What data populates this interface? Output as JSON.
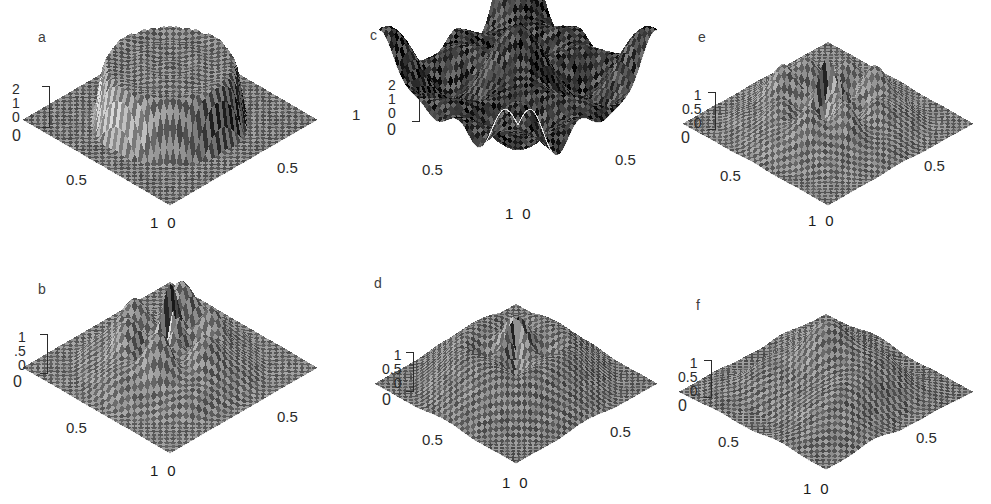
{
  "figure": {
    "type": "multi-panel-3d-surface-figure",
    "background_color": "#ffffff",
    "ink_color": "#2b2b2b",
    "panel_count": 6,
    "grid": "2 rows x 3 columns"
  },
  "panels": [
    {
      "id": "a",
      "letter": "a",
      "z_ticks": [
        "2",
        "1",
        "0"
      ],
      "z_origin_label": "0",
      "x_tick": "0.5",
      "y_tick": "0.5",
      "bottom_left_label": "1",
      "bottom_right_label": "0",
      "extra_right_label": "1",
      "surface": "single broad circular plateau (cylindrical mesa) on a flat base, with a raised rim and a depressed moat in the near quadrant",
      "zmax": 2,
      "shade": "#6e6e6e",
      "noise": 0.22
    },
    {
      "id": "b",
      "letter": "b",
      "z_ticks": [
        "1",
        ".5",
        "0"
      ],
      "z_origin_label": "0",
      "x_tick": "0.5",
      "y_tick": "0.5",
      "bottom_left_label": "1",
      "bottom_right_label": "0",
      "extra_right_label": "",
      "surface": "rippled multi-lobed dome with concentric wave structure and many small ridges",
      "zmax": 1,
      "shade": "#767676",
      "noise": 0.22
    },
    {
      "id": "c",
      "letter": "c",
      "z_ticks": [
        "2",
        "1",
        "0"
      ],
      "z_origin_label": "0",
      "x_tick": "0.5",
      "y_tick": "0.5",
      "bottom_left_label": "1",
      "bottom_right_label": "0",
      "extra_right_label": "",
      "surface": "very dark noisy surface with two broad bright humps near the back and a bright ridged fan in the front corner",
      "zmax": 2,
      "shade": "#2a2a2a",
      "noise": 0.55
    },
    {
      "id": "d",
      "letter": "d",
      "z_ticks": [
        "1",
        "0.5",
        "0"
      ],
      "z_origin_label": "0",
      "x_tick": "0.5",
      "y_tick": "0.5",
      "bottom_left_label": "1",
      "bottom_right_label": "0",
      "extra_right_label": "",
      "surface": "four-lobed ridged structure with deep dark clefts between the lobes, flat dark plateau behind",
      "zmax": 1,
      "shade": "#6b6b6b",
      "noise": 0.3
    },
    {
      "id": "e",
      "letter": "e",
      "z_ticks": [
        "1",
        "0.5",
        "0"
      ],
      "z_origin_label": "0",
      "x_tick": "0.5",
      "y_tick": "0.5",
      "bottom_left_label": "1",
      "bottom_right_label": "0",
      "extra_right_label": "",
      "surface": "rippled mound with a small star-shaped cluster of peaks at the centre and a dark circular ring",
      "zmax": 1,
      "shade": "#757575",
      "noise": 0.24
    },
    {
      "id": "f",
      "letter": "f",
      "z_ticks": [
        "1",
        "0.5",
        "0"
      ],
      "z_origin_label": "0",
      "x_tick": "0.5",
      "y_tick": "0.5",
      "bottom_left_label": "1",
      "bottom_right_label": "0",
      "extra_right_label": "",
      "surface": "broad corrugated ridges running diagonally, heavy dark shading on the right flank",
      "zmax": 1,
      "shade": "#6f6f6f",
      "noise": 0.3
    }
  ],
  "chart_data": {
    "type": "surface",
    "title": "",
    "subtitle": "",
    "xlabel": "",
    "ylabel": "",
    "zlabel": "",
    "xlim": [
      0,
      1
    ],
    "ylim": [
      0,
      1
    ],
    "grid": false,
    "legend": "none",
    "projection": "isometric wireframe mesh, viewed from above-front",
    "panels": [
      {
        "name": "a",
        "z_tick_labels": [
          "2",
          "1",
          "0"
        ],
        "z_values": [
          2,
          1,
          0
        ],
        "zlim": [
          0,
          2
        ],
        "x_tick_labels": [
          "0",
          "0.5",
          "1"
        ],
        "x_values": [
          0,
          0.5,
          1
        ],
        "y_tick_labels": [
          "0",
          "0.5",
          "1"
        ],
        "y_values": [
          0,
          0.5,
          1
        ],
        "description": "flat-topped circular plateau of height ~1.6 centred on the domain, surrounded by a ring-shaped depression, ambient plane at z=0"
      },
      {
        "name": "b",
        "z_tick_labels": [
          "1",
          ".5",
          "0"
        ],
        "z_values": [
          1,
          0.5,
          0
        ],
        "zlim": [
          0,
          1
        ],
        "x_tick_labels": [
          "0",
          "0.5",
          "1"
        ],
        "x_values": [
          0,
          0.5,
          1
        ],
        "y_tick_labels": [
          "0",
          "0.5",
          "1"
        ],
        "y_values": [
          0,
          0.5,
          1
        ],
        "description": "multi-lobed oscillatory mound peaking near 0.9, concentric ripples decaying to the flat boundary"
      },
      {
        "name": "c",
        "z_tick_labels": [
          "2",
          "1",
          "0"
        ],
        "z_values": [
          2,
          1,
          0
        ],
        "zlim": [
          0,
          2
        ],
        "x_tick_labels": [
          "0",
          "0.5",
          "1"
        ],
        "x_values": [
          0,
          0.5,
          1
        ],
        "y_tick_labels": [
          "0",
          "0.5",
          "1"
        ],
        "y_values": [
          0,
          0.5,
          1
        ],
        "description": "noisy high-amplitude surface reaching ~2 at the back with two bright saddle humps and a bright fan at the front corner"
      },
      {
        "name": "d",
        "z_tick_labels": [
          "1",
          "0.5",
          "0"
        ],
        "z_values": [
          1,
          0.5,
          0
        ],
        "zlim": [
          0,
          1
        ],
        "x_tick_labels": [
          "0",
          "0.5",
          "1"
        ],
        "x_values": [
          0,
          0.5,
          1
        ],
        "y_tick_labels": [
          "0",
          "0.5",
          "1"
        ],
        "y_values": [
          0,
          0.5,
          1
        ],
        "description": "four ridged lobes near height 1 separated by deep narrow valleys reaching near 0"
      },
      {
        "name": "e",
        "z_tick_labels": [
          "1",
          "0.5",
          "0"
        ],
        "z_values": [
          1,
          0.5,
          0
        ],
        "zlim": [
          0,
          1
        ],
        "x_tick_labels": [
          "0",
          "0.5",
          "1"
        ],
        "x_values": [
          0,
          0.5,
          1
        ],
        "y_tick_labels": [
          "0",
          "0.5",
          "1"
        ],
        "y_values": [
          0,
          0.5,
          1
        ],
        "description": "rippled mound peaking ~0.95 with a star-shaped cluster of small central peaks inside a dark annular trough"
      },
      {
        "name": "f",
        "z_tick_labels": [
          "1",
          "0.5",
          "0"
        ],
        "z_values": [
          1,
          0.5,
          0
        ],
        "zlim": [
          0,
          1
        ],
        "x_tick_labels": [
          "0",
          "0.5",
          "1"
        ],
        "x_values": [
          0,
          0.5,
          1
        ],
        "y_tick_labels": [
          "0",
          "0.5",
          "1"
        ],
        "y_values": [
          0,
          0.5,
          1
        ],
        "description": "corrugated surface of three broad diagonal ridges near height 0.9 with dark shaded right flank"
      }
    ]
  }
}
